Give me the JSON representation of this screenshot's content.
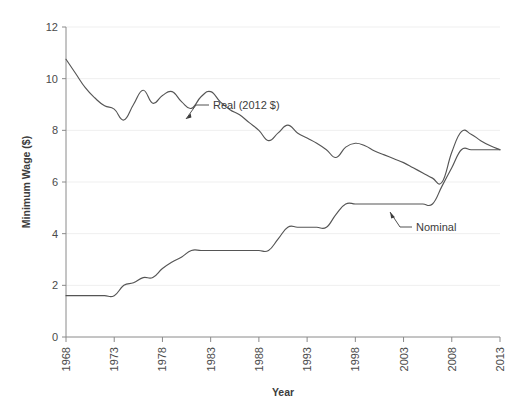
{
  "chart_data": {
    "type": "line",
    "title": "",
    "subtitle": "",
    "xlabel": "Year",
    "ylabel": "Minimum Wage ($)",
    "xlim": [
      1968,
      2013
    ],
    "ylim": [
      0,
      12
    ],
    "grid": true,
    "grid_axis": "y",
    "legend_position": "inline-annotations",
    "xticks": [
      1968,
      1973,
      1978,
      1983,
      1988,
      1993,
      1998,
      2003,
      2008,
      2013
    ],
    "xtick_labels": [
      "1968",
      "1973",
      "1978",
      "1983",
      "1988",
      "1993",
      "1998",
      "2003",
      "2008",
      "2013"
    ],
    "yticks": [
      0,
      2,
      4,
      6,
      8,
      10,
      12
    ],
    "ytick_labels": [
      "0",
      "2",
      "4",
      "6",
      "8",
      "10",
      "12"
    ],
    "line_color": "#555555",
    "grid_color": "#efefef",
    "axis_color": "#8a8a8a",
    "annotations": [
      {
        "name": "real-series-label",
        "text": "Real (2012 $)",
        "x": 1979.5,
        "y": 8.95
      },
      {
        "name": "nominal-series-label",
        "text": "Nominal",
        "x": 2001.0,
        "y": 4.25
      }
    ],
    "x": [
      1968,
      1969,
      1970,
      1971,
      1972,
      1973,
      1974,
      1975,
      1976,
      1977,
      1978,
      1979,
      1980,
      1981,
      1982,
      1983,
      1984,
      1985,
      1986,
      1987,
      1988,
      1989,
      1990,
      1991,
      1992,
      1993,
      1994,
      1995,
      1996,
      1997,
      1998,
      1999,
      2000,
      2001,
      2002,
      2003,
      2004,
      2005,
      2006,
      2007,
      2008,
      2009,
      2010,
      2011,
      2012,
      2013
    ],
    "series": [
      {
        "name": "Real (2012 $)",
        "label": "Real (2012 $)",
        "values": [
          10.75,
          10.2,
          9.65,
          9.25,
          8.95,
          8.82,
          8.4,
          9.0,
          9.55,
          9.05,
          9.35,
          9.5,
          9.1,
          8.85,
          9.3,
          9.5,
          9.1,
          8.8,
          8.6,
          8.3,
          8.0,
          7.6,
          7.9,
          8.2,
          7.9,
          7.7,
          7.5,
          7.25,
          6.95,
          7.35,
          7.5,
          7.4,
          7.2,
          7.05,
          6.9,
          6.75,
          6.55,
          6.35,
          6.15,
          6.0,
          7.15,
          7.95,
          7.85,
          7.6,
          7.4,
          7.25
        ]
      },
      {
        "name": "Nominal",
        "label": "Nominal",
        "values": [
          1.6,
          1.6,
          1.6,
          1.6,
          1.6,
          1.6,
          2.0,
          2.1,
          2.3,
          2.3,
          2.65,
          2.9,
          3.1,
          3.35,
          3.35,
          3.35,
          3.35,
          3.35,
          3.35,
          3.35,
          3.35,
          3.35,
          3.8,
          4.25,
          4.25,
          4.25,
          4.25,
          4.25,
          4.75,
          5.15,
          5.15,
          5.15,
          5.15,
          5.15,
          5.15,
          5.15,
          5.15,
          5.15,
          5.15,
          5.85,
          6.55,
          7.25,
          7.25,
          7.25,
          7.25,
          7.25
        ]
      }
    ]
  }
}
